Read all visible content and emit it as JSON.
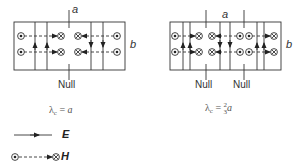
{
  "figure": {
    "left_mode": {
      "dim_a_label": "a",
      "dim_b_label": "b",
      "null_labels": [
        "Null"
      ],
      "formula": {
        "lhs": "λ",
        "sub": "c",
        "eq": "=",
        "rhs": "a"
      }
    },
    "right_mode": {
      "dim_a_label": "a",
      "dim_b_label": "b",
      "null_labels": [
        "Null",
        "Null"
      ],
      "formula": {
        "lhs": "λ",
        "sub": "c",
        "eq": "=",
        "num": "2",
        "den": "3",
        "rhs": "a"
      }
    },
    "legend": {
      "e_label": "E",
      "h_label": "H"
    },
    "colors": {
      "line": "#333333",
      "background": "#ffffff"
    }
  }
}
